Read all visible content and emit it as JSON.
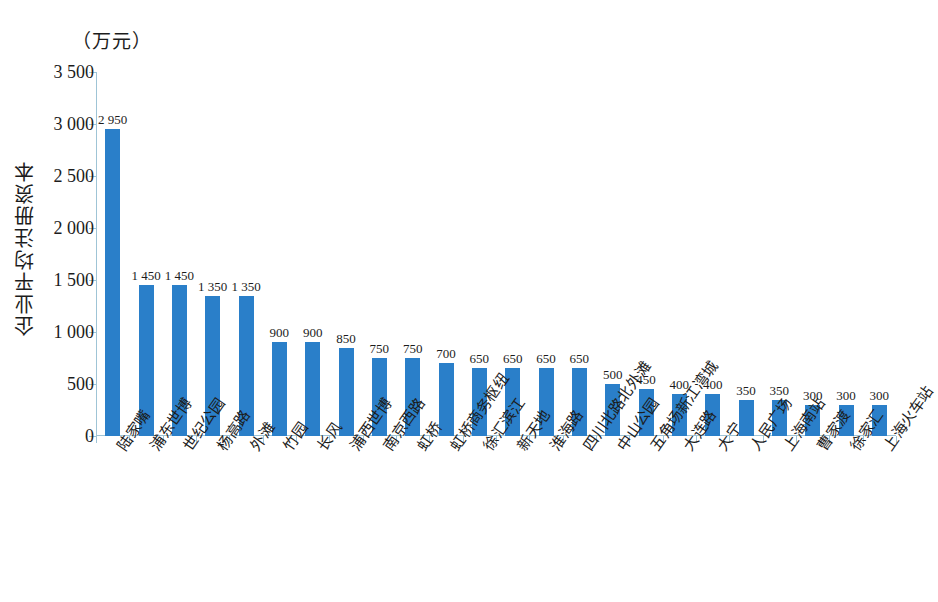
{
  "chart_data": {
    "type": "bar",
    "title": "",
    "unit_caption": "（万元）",
    "ylabel": "企业平均注册资本",
    "xlabel": "",
    "ylim": [
      0,
      3500
    ],
    "ytick_step": 500,
    "ytick_labels": [
      "0",
      "500",
      "1 000",
      "1 500",
      "2 000",
      "2 500",
      "3 000",
      "3 500"
    ],
    "ytick_values": [
      0,
      500,
      1000,
      1500,
      2000,
      2500,
      3000,
      3500
    ],
    "grid": false,
    "legend": false,
    "bar_color": "#2a7fc9",
    "axis_color": "#9fc4d6",
    "categories": [
      "陆家嘴",
      "浦东世博",
      "世纪公园",
      "杨高路",
      "外滩",
      "竹园",
      "长风",
      "浦西世博",
      "南京西路",
      "虹桥",
      "虹桥商务枢纽",
      "徐汇滨江",
      "新天地",
      "淮海路",
      "四川北路北外滩",
      "中山公园",
      "五角场新江湾城",
      "大连路",
      "大宁",
      "人民广场",
      "上海南站",
      "曹家渡",
      "徐家汇",
      "上海火车站"
    ],
    "values": [
      2950,
      1450,
      1450,
      1350,
      1350,
      900,
      900,
      850,
      750,
      750,
      700,
      650,
      650,
      650,
      650,
      500,
      450,
      400,
      400,
      350,
      350,
      300,
      300,
      300
    ],
    "value_labels": [
      "2 950",
      "1 450",
      "1 450",
      "1 350",
      "1 350",
      "900",
      "900",
      "850",
      "750",
      "750",
      "700",
      "650",
      "650",
      "650",
      "650",
      "500",
      "450",
      "400",
      "400",
      "350",
      "350",
      "300",
      "300",
      "300"
    ]
  }
}
